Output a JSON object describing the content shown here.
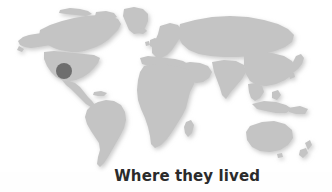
{
  "figure": {
    "kind": "world-map-figure",
    "background_color": "#fefefe",
    "width": 332,
    "height": 192
  },
  "caption": {
    "text": "Where they lived",
    "color": "#2b2b2b",
    "weight": "bold",
    "font_size_px": 15
  },
  "map": {
    "name": "world-map",
    "projection": "robinson-like",
    "land_color": "#c4c4c4",
    "land_shadow_color": "#e2e2e2",
    "ocean_color": "#ffffff",
    "regions": [
      "North America",
      "Greenland",
      "South America",
      "Europe",
      "Africa",
      "Asia",
      "Australia",
      "New Zealand",
      "Indonesia",
      "Japan",
      "British Isles",
      "Madagascar"
    ]
  },
  "marker": {
    "name": "range-marker",
    "shape": "circle",
    "color": "#6e6e6e",
    "center_x": 64,
    "center_y": 71,
    "diameter_px": 16,
    "location_label": "Western United States"
  }
}
